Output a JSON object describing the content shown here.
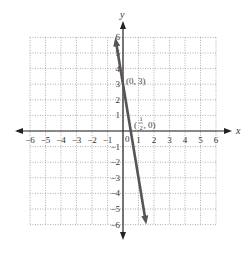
{
  "chart_data": {
    "type": "line",
    "title": "",
    "xlabel": "x",
    "ylabel": "y",
    "xlim": [
      -6,
      6
    ],
    "ylim": [
      -6,
      6
    ],
    "grid": true,
    "grid_style": "dotted",
    "x_ticks": [
      "-6",
      "-5",
      "-4",
      "-3",
      "-2",
      "-1",
      "0",
      "1",
      "2",
      "3",
      "4",
      "5",
      "6"
    ],
    "y_ticks": [
      "-6",
      "-5",
      "-4",
      "-3",
      "-2",
      "-1",
      "1",
      "2",
      "3",
      "4",
      "5",
      "6"
    ],
    "series": [
      {
        "name": "y = -6x + 3",
        "equation": "y = -6x + 3",
        "x": [
          -0.5,
          1.5
        ],
        "y": [
          6,
          -6
        ],
        "arrows": "both",
        "color": "#555555"
      }
    ],
    "annotations": [
      {
        "point": [
          0,
          3
        ],
        "label": "(0, 3)"
      },
      {
        "point": [
          0.5,
          0
        ],
        "label": "(1/2, 0)",
        "label_parts": {
          "num": "1",
          "den": "2",
          "rest": ", 0)"
        }
      }
    ],
    "legend": "none"
  },
  "labels": {
    "x_axis": "x",
    "y_axis": "y",
    "origin": "0",
    "pt1": "(0, 3)",
    "pt2_open": "(",
    "pt2_num": "1",
    "pt2_den": "2",
    "pt2_rest": ", 0)"
  },
  "ticks": {
    "x": [
      "−6",
      "−5",
      "−4",
      "−3",
      "−2",
      "−1",
      "1",
      "2",
      "3",
      "4",
      "5",
      "6"
    ],
    "y": [
      "6",
      "5",
      "4",
      "3",
      "2",
      "1",
      "−1",
      "−2",
      "−3",
      "−4",
      "−5",
      "−6"
    ]
  }
}
